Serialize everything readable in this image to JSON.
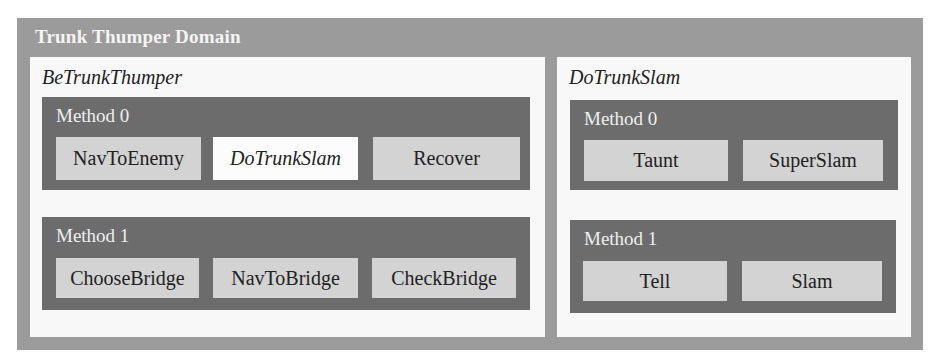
{
  "domain": {
    "title": "Trunk Thumper Domain",
    "colors": {
      "domain_bg": "#9b9b9b",
      "compound_bg": "#f8f8f8",
      "method_bg": "#6c6c6c",
      "task_bg": "#d3d3d3",
      "compound_ref_bg": "#fcfcfc"
    },
    "compounds": [
      {
        "name": "BeTrunkThumper",
        "methods": [
          {
            "label": "Method 0",
            "tasks": [
              {
                "label": "NavToEnemy",
                "type": "primitive"
              },
              {
                "label": "DoTrunkSlam",
                "type": "compound"
              },
              {
                "label": "Recover",
                "type": "primitive"
              }
            ]
          },
          {
            "label": "Method 1",
            "tasks": [
              {
                "label": "ChooseBridge",
                "type": "primitive"
              },
              {
                "label": "NavToBridge",
                "type": "primitive"
              },
              {
                "label": "CheckBridge",
                "type": "primitive"
              }
            ]
          }
        ]
      },
      {
        "name": "DoTrunkSlam",
        "methods": [
          {
            "label": "Method 0",
            "tasks": [
              {
                "label": "Taunt",
                "type": "primitive"
              },
              {
                "label": "SuperSlam",
                "type": "primitive"
              }
            ]
          },
          {
            "label": "Method 1",
            "tasks": [
              {
                "label": "Tell",
                "type": "primitive"
              },
              {
                "label": "Slam",
                "type": "primitive"
              }
            ]
          }
        ]
      }
    ]
  }
}
